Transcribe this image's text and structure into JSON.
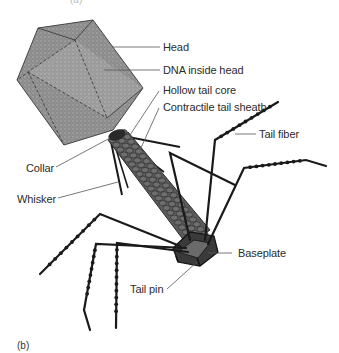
{
  "figure": {
    "panel_top_label": "(a)",
    "panel_label": "(b)"
  },
  "labels": {
    "head": "Head",
    "dna": "DNA inside head",
    "hollow_core": "Hollow tail core",
    "sheath": "Contractile tail sheath",
    "tail_fiber": "Tail fiber",
    "collar": "Collar",
    "whisker": "Whisker",
    "baseplate": "Baseplate",
    "tail_pin": "Tail pin"
  },
  "colors": {
    "head_fill": "#8a8a8a",
    "head_light": "#a8a8a8",
    "sheath_fill": "#5a5a5a",
    "line": "#1a1a1a",
    "leader": "#555555",
    "text": "#2b2b2b"
  }
}
